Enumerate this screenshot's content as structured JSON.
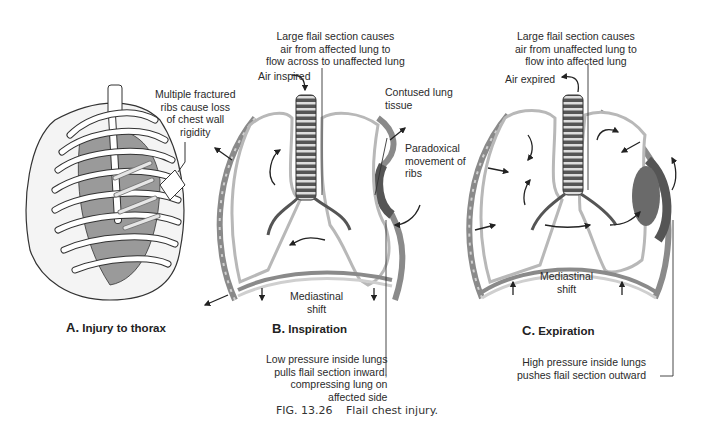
{
  "figure": {
    "caption_number": "FIG. 13.26",
    "caption_text": "Flail chest injury.",
    "colors": {
      "line": "#333333",
      "lung_outline": "#b8b8b8",
      "chest_wall": "#8a8a8a",
      "contusion": "#6a6a6a",
      "mediastinum_fill": "#d8d8d8"
    }
  },
  "panels": [
    {
      "id": "A",
      "letter": "A.",
      "title": "Injury to thorax",
      "labels": {
        "fractured_ribs": [
          "Multiple fractured",
          "ribs cause loss",
          "of chest wall",
          "rigidity"
        ]
      }
    },
    {
      "id": "B",
      "letter": "B.",
      "title": "Inspiration",
      "labels": {
        "top": [
          "Large flail section causes",
          "air from affected lung to",
          "flow across to unaffected lung"
        ],
        "air": "Air inspired",
        "contused": [
          "Contused lung",
          "tissue"
        ],
        "paradoxical": [
          "Paradoxical",
          "movement of",
          "ribs"
        ],
        "mediastinal": [
          "Mediastinal",
          "shift"
        ],
        "bottom": [
          "Low pressure inside lungs",
          "pulls flail section inward,",
          "compressing lung on",
          "affected side"
        ]
      }
    },
    {
      "id": "C",
      "letter": "C.",
      "title": "Expiration",
      "labels": {
        "top": [
          "Large flail section causes",
          "air from unaffected lung to",
          "flow into affected lung"
        ],
        "air": "Air expired",
        "mediastinal": [
          "Mediastinal",
          "shift"
        ],
        "bottom": [
          "High pressure inside lungs",
          "pushes flail section outward"
        ]
      }
    }
  ]
}
